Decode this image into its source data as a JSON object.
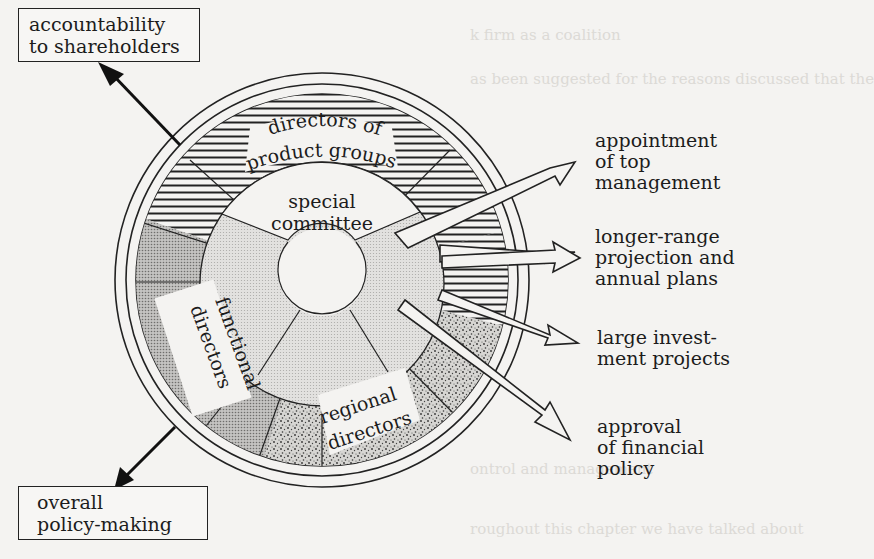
{
  "diagram": {
    "center_label": "special committee",
    "center_label_lines": [
      "special",
      "committee"
    ],
    "ring_segments": [
      {
        "id": "product",
        "label": "directors of product groups",
        "lines": [
          "directors of",
          "product groups"
        ],
        "pattern": "horizontal-hatch"
      },
      {
        "id": "functional",
        "label": "functional directors",
        "lines": [
          "functional",
          "directors"
        ],
        "pattern": "dense-dot"
      },
      {
        "id": "regional",
        "label": "regional directors",
        "lines": [
          "regional",
          "directors"
        ],
        "pattern": "stipple"
      }
    ],
    "inputs": [
      {
        "id": "accountability",
        "lines": [
          "accountability",
          "to shareholders"
        ]
      },
      {
        "id": "policy",
        "lines": [
          "overall",
          "policy-making"
        ]
      }
    ],
    "outputs": [
      {
        "id": "appointment",
        "lines": [
          "appointment",
          "of top",
          "management"
        ]
      },
      {
        "id": "projection",
        "lines": [
          "longer-range",
          "projection and",
          "annual plans"
        ]
      },
      {
        "id": "investment",
        "lines": [
          "large invest-",
          "ment projects"
        ]
      },
      {
        "id": "financial",
        "lines": [
          "approval",
          "of financial",
          "policy"
        ]
      }
    ]
  },
  "colors": {
    "ink": "#1c1c1c",
    "paper": "#f4f3f1",
    "functional_fill": "#b9b8b6",
    "committee_fill": "#dcdbd9",
    "stipple_fill": "#c9c8c5"
  }
}
